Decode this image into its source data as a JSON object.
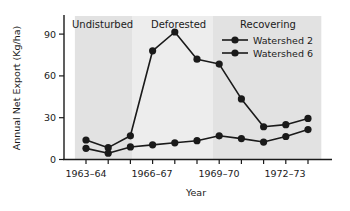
{
  "chart_data": {
    "type": "line",
    "title": "",
    "xlabel": "Year",
    "ylabel": "Annual Net Export (Kg/ha)",
    "ylim": [
      0,
      100
    ],
    "yticks": [
      0,
      30,
      60,
      90
    ],
    "ytick_labels": [
      "0",
      "30",
      "60",
      "90"
    ],
    "grid": false,
    "legend_position": "top-right",
    "x_index": [
      0,
      1,
      2,
      3,
      4,
      5,
      6,
      7,
      8,
      9,
      10
    ],
    "categories": [
      "1963–64",
      "1964–65",
      "1965–66",
      "1966–67",
      "1967–68",
      "1968–69",
      "1969–70",
      "1970–71",
      "1971–72",
      "1972–73",
      "1973–74"
    ],
    "xtick_labels": [
      "1963–64",
      "1966–67",
      "1969–70",
      "1972–73"
    ],
    "xtick_index": [
      0,
      3,
      6,
      9
    ],
    "series": [
      {
        "name": "Watershed 2",
        "color": "#1a1a1a",
        "values": [
          14,
          8.5,
          17,
          78,
          91.5,
          72,
          68.5,
          43.5,
          23.5,
          25,
          29.5
        ]
      },
      {
        "name": "Watershed 6",
        "color": "#1a1a1a",
        "values": [
          8,
          4.5,
          9,
          10.5,
          12,
          13.5,
          17,
          15,
          12.5,
          16.5,
          21.5
        ]
      }
    ],
    "regions": [
      {
        "label": "Undisturbed",
        "start_index": -0.5,
        "end_index": 2.1,
        "color": "#e2e2e2"
      },
      {
        "label": "Deforested",
        "start_index": 2.1,
        "end_index": 5.7,
        "color": "#ededed"
      },
      {
        "label": "Recovering",
        "start_index": 5.7,
        "end_index": 10.6,
        "color": "#e2e2e2"
      }
    ]
  },
  "legend": {
    "items": [
      {
        "label": "Watershed 2"
      },
      {
        "label": "Watershed 6"
      }
    ]
  },
  "axes": {
    "y_title": "Annual Net Export (Kg/ha)",
    "x_title": "Year",
    "y_tick_0": "0",
    "y_tick_1": "30",
    "y_tick_2": "60",
    "y_tick_3": "90",
    "x_tick_0": "1963–64",
    "x_tick_1": "1966–67",
    "x_tick_2": "1969–70",
    "x_tick_3": "1972–73"
  },
  "regions": {
    "r0": "Undisturbed",
    "r1": "Deforested",
    "r2": "Recovering"
  }
}
